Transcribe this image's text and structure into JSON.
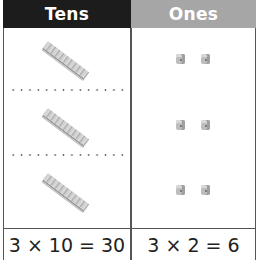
{
  "header": {
    "tens_label": "Tens",
    "ones_label": "Ones"
  },
  "colors": {
    "tens_header_bg": "#1c1c1c",
    "ones_header_bg": "#a6a6a6",
    "header_text": "#ffffff",
    "block_gray": "#c0c0c0"
  },
  "rows": [
    {
      "tens_blocks": 1,
      "ones_blocks": 2
    },
    {
      "tens_blocks": 1,
      "ones_blocks": 2
    },
    {
      "tens_blocks": 1,
      "ones_blocks": 2
    }
  ],
  "equations": {
    "tens": "3 × 10 = 30",
    "ones": "3 × 2 = 6"
  },
  "icons": {
    "tens_block": "ten-rod-icon",
    "ones_block": "unit-cube-icon"
  }
}
